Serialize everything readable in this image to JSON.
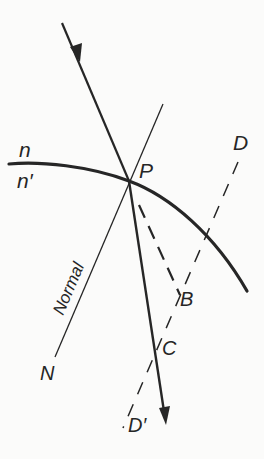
{
  "diagram": {
    "colors": {
      "ink": "#262626",
      "background": "#fbfbfa"
    },
    "labels": {
      "n": "n",
      "n_prime": "n′",
      "P": "P",
      "D": "D",
      "D_prime": "D′",
      "B": "B",
      "C": "C",
      "N": "N",
      "normal": "Normal"
    },
    "elements": [
      {
        "id": "surface",
        "type": "curve",
        "desc": "refracting surface separating media n and n'"
      },
      {
        "id": "incident-ray",
        "type": "arrow",
        "from": "top-left",
        "to": "P"
      },
      {
        "id": "refracted-ray",
        "type": "arrow",
        "from": "P",
        "to": "bottom"
      },
      {
        "id": "normal-line",
        "type": "line",
        "through": "P",
        "label": "Normal",
        "end_label": "N"
      },
      {
        "id": "undeviated-ray",
        "type": "dashed-line",
        "from": "P",
        "to": "B"
      },
      {
        "id": "construction-line",
        "type": "dashed-line",
        "from": "D",
        "to": "D'",
        "passes": [
          "B",
          "C"
        ]
      }
    ]
  }
}
